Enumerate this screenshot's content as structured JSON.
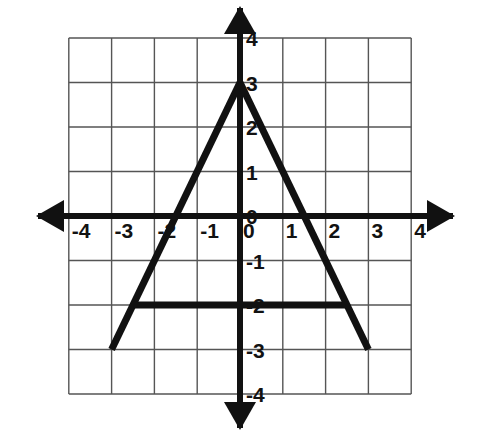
{
  "figure": {
    "background_color": "#ffffff",
    "grid_line_color": "#555555",
    "axis_color": "#111111",
    "shape_color": "#111111"
  },
  "axes": {
    "x_axis_label_name": "x-axis",
    "y_axis_label_name": "y-axis",
    "x_ticks": [
      "-4",
      "-3",
      "-2",
      "-1",
      "0",
      "1",
      "2",
      "3",
      "4"
    ],
    "y_ticks": [
      "4",
      "3",
      "2",
      "1",
      "0",
      "-1",
      "-2",
      "-3",
      "-4"
    ]
  },
  "chart_data": {
    "type": "line",
    "xlabel": "",
    "ylabel": "",
    "xlim": [
      -4,
      4
    ],
    "ylim": [
      -4,
      4
    ],
    "grid": true,
    "legend": "none",
    "x_tick_values": [
      -4,
      -3,
      -2,
      -1,
      0,
      1,
      2,
      3,
      4
    ],
    "y_tick_values": [
      4,
      3,
      2,
      1,
      0,
      -1,
      -2,
      -3,
      -4
    ],
    "x_tick_labels": [
      "-4",
      "-3",
      "-2",
      "-1",
      "0",
      "1",
      "2",
      "3",
      "4"
    ],
    "y_tick_labels": [
      "4",
      "3",
      "2",
      "1",
      "0",
      "-1",
      "-2",
      "-3",
      "-4"
    ],
    "series": [
      {
        "name": "left-leg",
        "points": [
          [
            -3,
            -3
          ],
          [
            0,
            3
          ]
        ]
      },
      {
        "name": "right-leg",
        "points": [
          [
            0,
            3
          ],
          [
            3,
            -3
          ]
        ]
      },
      {
        "name": "crossbar",
        "points": [
          [
            -2.5,
            -2
          ],
          [
            2.5,
            -2
          ]
        ]
      }
    ],
    "annotations": [
      {
        "name": "apex",
        "x": 0,
        "y": 3
      },
      {
        "name": "left-foot",
        "x": -3,
        "y": -3
      },
      {
        "name": "right-foot",
        "x": 3,
        "y": -3
      }
    ]
  },
  "x_tick_items": [
    {
      "label": "-4",
      "value": -4
    },
    {
      "label": "-3",
      "value": -3
    },
    {
      "label": "-2",
      "value": -2
    },
    {
      "label": "-1",
      "value": -1
    },
    {
      "label": "0",
      "value": 0
    },
    {
      "label": "1",
      "value": 1
    },
    {
      "label": "2",
      "value": 2
    },
    {
      "label": "3",
      "value": 3
    },
    {
      "label": "4",
      "value": 4
    }
  ],
  "y_tick_items": [
    {
      "label": "4",
      "value": 4
    },
    {
      "label": "3",
      "value": 3
    },
    {
      "label": "2",
      "value": 2
    },
    {
      "label": "1",
      "value": 1
    },
    {
      "label": "0",
      "value": 0
    },
    {
      "label": "-1",
      "value": -1
    },
    {
      "label": "-2",
      "value": -2
    },
    {
      "label": "-3",
      "value": -3
    },
    {
      "label": "-4",
      "value": -4
    }
  ]
}
